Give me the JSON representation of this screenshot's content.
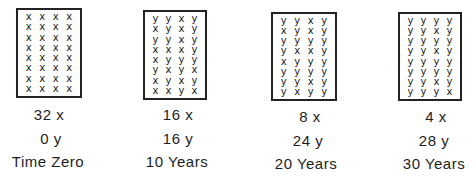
{
  "diagram": {
    "panels": [
      {
        "count_x": "32 x",
        "count_y": "0 y",
        "time": "Time Zero",
        "grid": [
          [
            "x",
            "x",
            "x",
            "x"
          ],
          [
            "x",
            "x",
            "x",
            "x"
          ],
          [
            "x",
            "x",
            "x",
            "x"
          ],
          [
            "x",
            "x",
            "x",
            "x"
          ],
          [
            "x",
            "x",
            "x",
            "x"
          ],
          [
            "x",
            "x",
            "x",
            "x"
          ],
          [
            "x",
            "x",
            "x",
            "x"
          ],
          [
            "x",
            "x",
            "x",
            "x"
          ]
        ]
      },
      {
        "count_x": "16 x",
        "count_y": "16 y",
        "time": "10 Years",
        "grid": [
          [
            "y",
            "y",
            "x",
            "y"
          ],
          [
            "x",
            "y",
            "x",
            "y"
          ],
          [
            "y",
            "y",
            "x",
            "y"
          ],
          [
            "x",
            "x",
            "x",
            "y"
          ],
          [
            "x",
            "y",
            "y",
            "y"
          ],
          [
            "y",
            "x",
            "y",
            "x"
          ],
          [
            "x",
            "y",
            "x",
            "y"
          ],
          [
            "x",
            "x",
            "y",
            "x"
          ]
        ]
      },
      {
        "count_x": "8 x",
        "count_y": "24 y",
        "time": "20 Years",
        "grid": [
          [
            "y",
            "y",
            "x",
            "y"
          ],
          [
            "x",
            "y",
            "x",
            "y"
          ],
          [
            "y",
            "y",
            "y",
            "y"
          ],
          [
            "y",
            "x",
            "x",
            "y"
          ],
          [
            "x",
            "y",
            "y",
            "y"
          ],
          [
            "y",
            "y",
            "y",
            "y"
          ],
          [
            "y",
            "y",
            "x",
            "y"
          ],
          [
            "y",
            "x",
            "y",
            "y"
          ]
        ]
      },
      {
        "count_x": "4 x",
        "count_y": "28 y",
        "time": "30 Years",
        "grid": [
          [
            "y",
            "y",
            "y",
            "y"
          ],
          [
            "y",
            "y",
            "x",
            "y"
          ],
          [
            "y",
            "y",
            "y",
            "y"
          ],
          [
            "y",
            "y",
            "x",
            "y"
          ],
          [
            "y",
            "y",
            "y",
            "y"
          ],
          [
            "y",
            "y",
            "y",
            "y"
          ],
          [
            "y",
            "y",
            "x",
            "y"
          ],
          [
            "y",
            "y",
            "y",
            "x"
          ]
        ]
      }
    ]
  }
}
